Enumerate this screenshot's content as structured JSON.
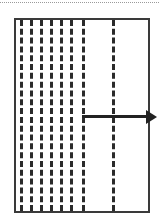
{
  "figure": {
    "title": "",
    "background_color": "#ffffff",
    "width": 159,
    "height": 224
  },
  "top_rule": {
    "name": "dotted-rule",
    "color": "#9a9a9a",
    "style": "dotted",
    "y": 2
  },
  "frame": {
    "name": "boundary-rectangle",
    "border_color": "#3a3a3a",
    "border_width": 2,
    "x": 14,
    "y": 18,
    "width": 136,
    "height": 195
  },
  "chart_data": {
    "type": "diagram",
    "title": "",
    "xlabel": "",
    "ylabel": "",
    "dashed_lines": [
      {
        "id": "line-1",
        "x": 20,
        "color": "#2b2b2b",
        "dash": "3px dashed"
      },
      {
        "id": "line-2",
        "x": 30,
        "color": "#2b2b2b",
        "dash": "3px dashed"
      },
      {
        "id": "line-3",
        "x": 40,
        "color": "#2b2b2b",
        "dash": "3px dashed"
      },
      {
        "id": "line-4",
        "x": 50,
        "color": "#2b2b2b",
        "dash": "3px dashed"
      },
      {
        "id": "line-5",
        "x": 60,
        "color": "#2b2b2b",
        "dash": "3px dashed"
      },
      {
        "id": "line-6",
        "x": 70,
        "color": "#2b2b2b",
        "dash": "3px dashed"
      },
      {
        "id": "line-7",
        "x": 82,
        "color": "#2b2b2b",
        "dash": "3px dashed"
      },
      {
        "id": "line-8",
        "x": 112,
        "color": "#2b2b2b",
        "dash": "3px dashed"
      }
    ],
    "arrow": {
      "id": "direction-arrow",
      "color": "#222222",
      "x_start": 82,
      "x_end": 157,
      "y": 115,
      "shaft_thickness": 3,
      "head_length": 11,
      "head_width": 14,
      "direction": "right",
      "label": ""
    }
  }
}
